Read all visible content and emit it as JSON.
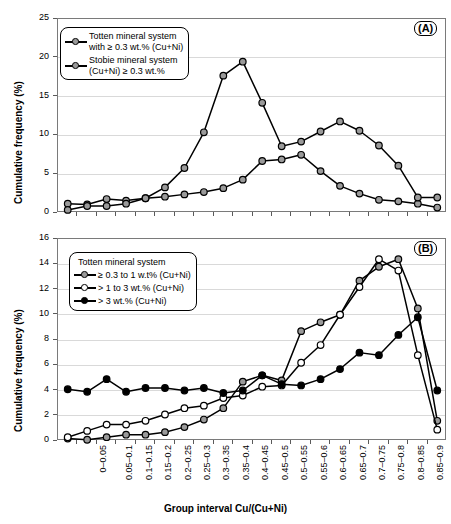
{
  "figure": {
    "y_axis_title": "Cumulative frequency (%)",
    "x_axis_title": "Group interval Cu/(Cu+Ni)",
    "panel_a_tag": "(A)",
    "panel_b_tag": "(B)"
  },
  "legend_a": {
    "entries": [
      {
        "marker": "grey-circle",
        "line1": "Totten mineral system",
        "line2": "with ≥ 0.3 wt.% (Cu+Ni)"
      },
      {
        "marker": "grey-circle",
        "line1": "Stobie mineral system",
        "line2": "(Cu+Ni) ≥ 0.3 wt.%"
      }
    ]
  },
  "legend_b": {
    "title": "Totten mineral system",
    "entries": [
      {
        "marker": "grey-circle",
        "label": "≥ 0.3 to 1 w.t% (Cu+Ni)"
      },
      {
        "marker": "white-circle",
        "label": "> 1 to 3 wt.% (Cu+Ni)"
      },
      {
        "marker": "black-circle",
        "label": "> 3 wt.% (Cu+Ni)"
      }
    ]
  },
  "chart_data": [
    {
      "id": "panel-a",
      "type": "line",
      "title": "",
      "xlabel": "Group interval Cu/(Cu+Ni)",
      "ylabel": "Cumulative frequency (%)",
      "ylim": [
        0,
        25
      ],
      "yticks": [
        0,
        5,
        10,
        15,
        20,
        25
      ],
      "grid": true,
      "legend_position": "top-left",
      "categories": [
        "0–0.05",
        "0.05–0.1",
        "0.1–0.15",
        "0.15–0.2",
        "0.2–0.25",
        "0.25–0.3",
        "0.3–0.35",
        "0.35–0.4",
        "0.4–0.45",
        "0.45–0.5",
        "0.5–0.55",
        "0.55–0.6",
        "0.6–0.65",
        "0.65–0.7",
        "0.7–0.75",
        "0.75–0.8",
        "0.8–0.85",
        "0.85–0.9",
        "0.9–0.95",
        "0.95–1.0"
      ],
      "series": [
        {
          "name": "Totten mineral system with ≥ 0.3 wt.% (Cu+Ni)",
          "marker": "grey-circle",
          "values": [
            1.2,
            1.1,
            1.8,
            1.6,
            1.9,
            2.1,
            2.4,
            2.7,
            3.2,
            4.3,
            6.7,
            6.9,
            7.5,
            5.4,
            3.5,
            2.5,
            1.7,
            1.5,
            1.2,
            0.7
          ]
        },
        {
          "name": "Stobie mineral system (Cu+Ni) ≥ 0.3 wt.%",
          "marker": "grey-circle",
          "values": [
            0.4,
            0.9,
            0.9,
            1.2,
            1.9,
            3.3,
            5.8,
            10.4,
            17.7,
            19.5,
            14.2,
            8.6,
            9.2,
            10.5,
            11.8,
            10.6,
            8.7,
            6.1,
            2.0,
            2.0
          ]
        }
      ]
    },
    {
      "id": "panel-b",
      "type": "line",
      "title": "",
      "xlabel": "Group interval Cu/(Cu+Ni)",
      "ylabel": "Cumulative frequency (%)",
      "ylim": [
        0,
        16
      ],
      "yticks": [
        0,
        2,
        4,
        6,
        8,
        10,
        12,
        14,
        16
      ],
      "grid": true,
      "legend_position": "top-left",
      "categories": [
        "0–0.05",
        "0.05–0.1",
        "0.1–0.15",
        "0.15–0.2",
        "0.2–0.25",
        "0.25–0.3",
        "0.3–0.35",
        "0.35–0.4",
        "0.4–0.45",
        "0.45–0.5",
        "0.5–0.55",
        "0.55–0.6",
        "0.6–0.65",
        "0.65–0.7",
        "0.7–0.75",
        "0.75–0.8",
        "0.8–0.85",
        "0.85–0.9",
        "0.9–0.95",
        "0.95–1.0"
      ],
      "series": [
        {
          "name": "≥ 0.3 to 1 w.t% (Cu+Ni)",
          "marker": "grey-circle",
          "values": [
            0.2,
            0.1,
            0.3,
            0.5,
            0.5,
            0.7,
            1.1,
            1.7,
            2.6,
            4.7,
            5.2,
            4.8,
            8.7,
            9.4,
            10.0,
            12.7,
            13.8,
            14.4,
            10.5,
            1.6
          ]
        },
        {
          "name": "> 1 to 3 wt.% (Cu+Ni)",
          "marker": "white-circle",
          "values": [
            0.3,
            0.8,
            1.3,
            1.3,
            1.6,
            2.1,
            2.6,
            2.8,
            3.4,
            3.6,
            4.3,
            4.4,
            6.2,
            7.6,
            10.0,
            12.2,
            14.4,
            13.5,
            6.8,
            0.9
          ]
        },
        {
          "name": "> 3 wt.% (Cu+Ni)",
          "marker": "black-circle",
          "values": [
            4.1,
            3.9,
            4.9,
            3.9,
            4.2,
            4.2,
            4.0,
            4.2,
            3.8,
            4.0,
            5.2,
            4.5,
            4.4,
            4.9,
            5.7,
            7.0,
            6.8,
            8.4,
            9.8,
            4.0
          ]
        }
      ]
    }
  ]
}
